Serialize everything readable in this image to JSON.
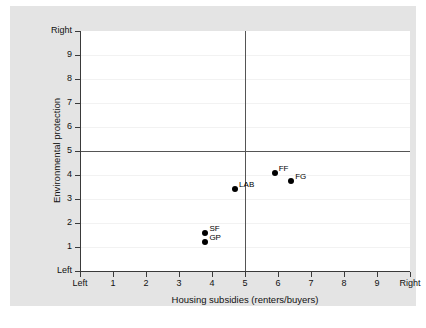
{
  "chart_data": {
    "type": "scatter",
    "title": "",
    "xlabel": "Housing subsidies (renters/buyers)",
    "ylabel": "Environmental protection",
    "xlim": [
      0,
      10
    ],
    "ylim": [
      0,
      10
    ],
    "grid": true,
    "legend": "none",
    "x_ticks": [
      {
        "value": 0,
        "label": "Left"
      },
      {
        "value": 1,
        "label": "1"
      },
      {
        "value": 2,
        "label": "2"
      },
      {
        "value": 3,
        "label": "3"
      },
      {
        "value": 4,
        "label": "4"
      },
      {
        "value": 5,
        "label": "5"
      },
      {
        "value": 6,
        "label": "6"
      },
      {
        "value": 7,
        "label": "7"
      },
      {
        "value": 8,
        "label": "8"
      },
      {
        "value": 9,
        "label": "9"
      },
      {
        "value": 10,
        "label": "Right"
      }
    ],
    "y_ticks": [
      {
        "value": 0,
        "label": "Left"
      },
      {
        "value": 1,
        "label": "1"
      },
      {
        "value": 2,
        "label": "2"
      },
      {
        "value": 3,
        "label": "3"
      },
      {
        "value": 4,
        "label": "4"
      },
      {
        "value": 5,
        "label": "5"
      },
      {
        "value": 6,
        "label": "6"
      },
      {
        "value": 7,
        "label": "7"
      },
      {
        "value": 8,
        "label": "8"
      },
      {
        "value": 9,
        "label": "9"
      },
      {
        "value": 10,
        "label": "Right"
      }
    ],
    "reference_lines": [
      {
        "axis": "x",
        "value": 5
      },
      {
        "axis": "y",
        "value": 5
      }
    ],
    "points": [
      {
        "label": "LAB",
        "x": 4.7,
        "y": 3.4
      },
      {
        "label": "FF",
        "x": 5.9,
        "y": 4.1
      },
      {
        "label": "FG",
        "x": 6.4,
        "y": 3.75
      },
      {
        "label": "SF",
        "x": 3.8,
        "y": 1.6
      },
      {
        "label": "GP",
        "x": 3.8,
        "y": 1.2
      }
    ],
    "colors": {
      "marker": "#000000",
      "plot_background": "#ffffff",
      "graph_background": "#e4e4e4",
      "axis": "#3a3a3a",
      "gridline": "#f2f2f2",
      "reference_line": "#555555"
    }
  }
}
